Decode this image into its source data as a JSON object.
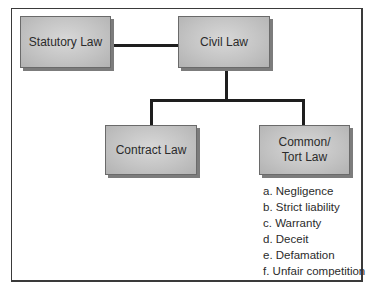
{
  "diagram": {
    "nodes": {
      "statutory_law": "Statutory Law",
      "civil_law": "Civil Law",
      "contract_law": "Contract Law",
      "common_tort_law_line1": "Common/",
      "common_tort_law_line2": "Tort Law"
    },
    "edges": [
      {
        "from": "Statutory Law",
        "to": "Civil Law"
      },
      {
        "from": "Civil Law",
        "to": "Contract Law"
      },
      {
        "from": "Civil Law",
        "to": "Common/Tort Law"
      }
    ],
    "tort_types": [
      "a. Negligence",
      "b. Strict liability",
      "c. Warranty",
      "d. Deceit",
      "e. Defamation",
      "f. Unfair competition"
    ]
  }
}
